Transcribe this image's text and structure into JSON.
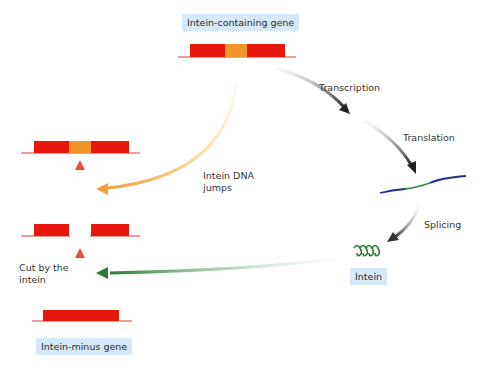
{
  "diagram": {
    "title_tags": {
      "intein_containing_gene": "Intein-containing gene",
      "intein_minus_gene": "Intein-minus gene",
      "intein": "Intein"
    },
    "steps": {
      "transcription": "Transcription",
      "translation": "Translation",
      "splicing": "Splicing"
    },
    "annotations": {
      "intein_dna_jumps_line1": "Intein DNA",
      "intein_dna_jumps_line2": "jumps",
      "cut_by_intein_line1": "Cut by the",
      "cut_by_intein_line2": "intein"
    },
    "colors": {
      "exon_red": "#e8170c",
      "intein_orange": "#f0962a",
      "baseline_red": "#e03a2a",
      "protein_blue": "#1f2f8a",
      "protein_green": "#2e8b3a",
      "intein_green": "#2a7a34",
      "arrow_dark": "#333333",
      "arrow_yellow": "#f0a23a",
      "arrow_red": "#e8503a",
      "tag_bg": "#d6e9f8"
    }
  }
}
